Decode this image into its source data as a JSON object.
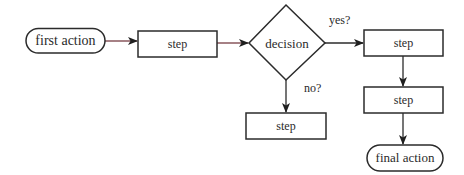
{
  "diagram": {
    "type": "flowchart",
    "nodes": {
      "start": {
        "label": "first action",
        "shape": "terminal"
      },
      "step1": {
        "label": "step",
        "shape": "process"
      },
      "decision": {
        "label": "decision",
        "shape": "decision"
      },
      "step_yes": {
        "label": "step",
        "shape": "process"
      },
      "step_yes2": {
        "label": "step",
        "shape": "process"
      },
      "step_no": {
        "label": "step",
        "shape": "process"
      },
      "end": {
        "label": "final action",
        "shape": "terminal"
      }
    },
    "edges": {
      "yes_label": "yes?",
      "no_label": "no?"
    },
    "colors": {
      "stroke": "#2b2b2b",
      "connector_tint": "#6b2d33",
      "text": "#2a2a2a",
      "background": "#ffffff"
    }
  }
}
